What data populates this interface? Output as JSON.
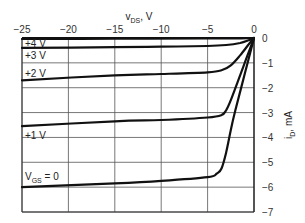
{
  "chart_data": {
    "type": "line",
    "title": "",
    "xlabel": "v_DS, V",
    "xlabel_main": "v",
    "xlabel_sub": "DS",
    "xlabel_unit": ", V",
    "ylabel": "i_D, mA",
    "ylabel_main": "i",
    "ylabel_sub": "D",
    "ylabel_unit": ", mA",
    "xlim": [
      -25,
      0
    ],
    "ylim": [
      -7,
      0
    ],
    "grid": true,
    "x_ticks": [
      -25,
      -20,
      -15,
      -10,
      -5,
      0
    ],
    "x_tick_labels": [
      "−25",
      "−20",
      "−15",
      "−10",
      "−5",
      "0"
    ],
    "y_ticks": [
      0,
      -1,
      -2,
      -3,
      -4,
      -5,
      -6,
      -7
    ],
    "y_tick_labels": [
      "0",
      "−1",
      "−2",
      "−3",
      "−4",
      "−5",
      "−6",
      "−7"
    ],
    "series": [
      {
        "name": "+4 V",
        "label": "+4 V",
        "x": [
          -25,
          -15,
          -5,
          -2,
          -0.5,
          0
        ],
        "y": [
          -0.04,
          -0.03,
          -0.02,
          -0.02,
          -0.01,
          0
        ]
      },
      {
        "name": "+3 V",
        "label": "+3 V",
        "x": [
          -25,
          -15,
          -10,
          -5,
          -3,
          -1.5,
          -0.5,
          0
        ],
        "y": [
          -0.4,
          -0.37,
          -0.35,
          -0.32,
          -0.28,
          -0.2,
          -0.08,
          0
        ]
      },
      {
        "name": "+2 V",
        "label": "+2 V",
        "x": [
          -25,
          -15,
          -10,
          -5,
          -3.5,
          -2.5,
          -1.5,
          -0.5,
          0
        ],
        "y": [
          -1.7,
          -1.5,
          -1.45,
          -1.38,
          -1.3,
          -1.1,
          -0.7,
          -0.22,
          0
        ]
      },
      {
        "name": "+1 V",
        "label": "+1 V",
        "x": [
          -25,
          -15,
          -10,
          -5,
          -3.5,
          -3,
          -2.5,
          -1.5,
          -0.5,
          0
        ],
        "y": [
          -3.55,
          -3.35,
          -3.3,
          -3.2,
          -3.1,
          -2.9,
          -2.5,
          -1.5,
          -0.5,
          0
        ]
      },
      {
        "name": "VGS = 0",
        "label": "V_GS = 0",
        "x": [
          -25,
          -15,
          -10,
          -5,
          -4,
          -3.5,
          -3,
          -2.5,
          -2,
          -1,
          0
        ],
        "y": [
          -6.0,
          -5.85,
          -5.75,
          -5.6,
          -5.45,
          -5.25,
          -4.6,
          -3.7,
          -2.9,
          -1.45,
          0
        ]
      }
    ],
    "legend": "inline labels"
  },
  "labels": {
    "plus4": "+4 V",
    "plus3": "+3 V",
    "plus2": "+2 V",
    "plus1": "+1 V",
    "vgs_main": "V",
    "vgs_sub": "GS",
    "vgs_tail": " = 0"
  }
}
